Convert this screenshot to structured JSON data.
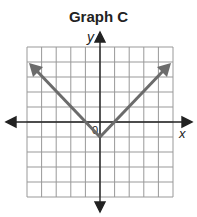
{
  "title": "Graph C",
  "axes": {
    "x_label": "x",
    "y_label": "y",
    "origin_label": "0"
  },
  "grid": {
    "columns": 10,
    "rows": 10,
    "x_range": [
      -5,
      5
    ],
    "y_range": [
      -5,
      5
    ]
  },
  "graph": {
    "type": "absolute-value",
    "vertex": [
      0,
      -1
    ],
    "left_ray_end": [
      -5,
      4
    ],
    "right_ray_end": [
      5,
      4
    ],
    "line_color": "#6b6b6b",
    "grid_color": "#999999"
  }
}
